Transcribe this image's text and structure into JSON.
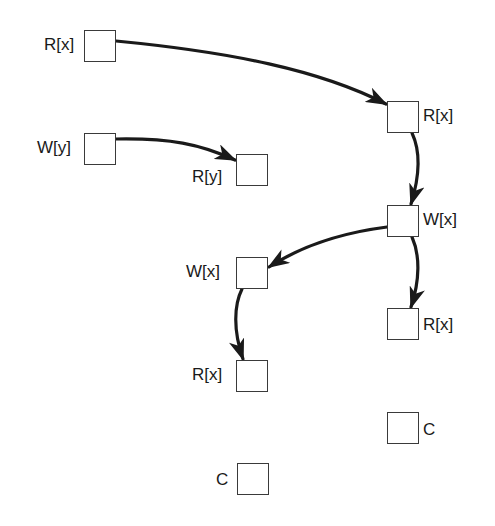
{
  "diagram": {
    "type": "directed-graph",
    "stroke_color": "#1a1a1a",
    "node_border_color": "#3a3a3a",
    "background": "#ffffff",
    "nodes": [
      {
        "id": "n1",
        "label": "R[x]",
        "label_side": "left",
        "x": 84,
        "y": 30
      },
      {
        "id": "n2",
        "label": "R[x]",
        "label_side": "right",
        "x": 387,
        "y": 101
      },
      {
        "id": "n3",
        "label": "W[y]",
        "label_side": "left",
        "x": 84,
        "y": 133
      },
      {
        "id": "n4",
        "label": "R[y]",
        "label_side": "left",
        "x": 236,
        "y": 154
      },
      {
        "id": "n5",
        "label": "W[x]",
        "label_side": "right",
        "x": 387,
        "y": 205
      },
      {
        "id": "n6",
        "label": "W[x]",
        "label_side": "left",
        "x": 236,
        "y": 257
      },
      {
        "id": "n7",
        "label": "R[x]",
        "label_side": "right",
        "x": 387,
        "y": 308
      },
      {
        "id": "n8",
        "label": "R[x]",
        "label_side": "left",
        "x": 236,
        "y": 360
      },
      {
        "id": "n9",
        "label": "C",
        "label_side": "right",
        "x": 387,
        "y": 412
      },
      {
        "id": "n10",
        "label": "C",
        "label_side": "left",
        "x": 237,
        "y": 463
      }
    ],
    "edges": [
      {
        "from": "n1",
        "to": "n2",
        "path": "M116,41 C230,52 320,70 386,104"
      },
      {
        "from": "n3",
        "to": "n4",
        "path": "M116,139 C170,138 200,144 235,160"
      },
      {
        "from": "n2",
        "to": "n5",
        "path": "M412,133 C420,150 420,175 411,204"
      },
      {
        "from": "n5",
        "to": "n6",
        "path": "M387,227 C340,233 300,247 269,267"
      },
      {
        "from": "n5",
        "to": "n7",
        "path": "M412,237 C420,255 420,280 411,307"
      },
      {
        "from": "n6",
        "to": "n8",
        "path": "M242,289 C234,305 233,330 243,359"
      }
    ]
  }
}
